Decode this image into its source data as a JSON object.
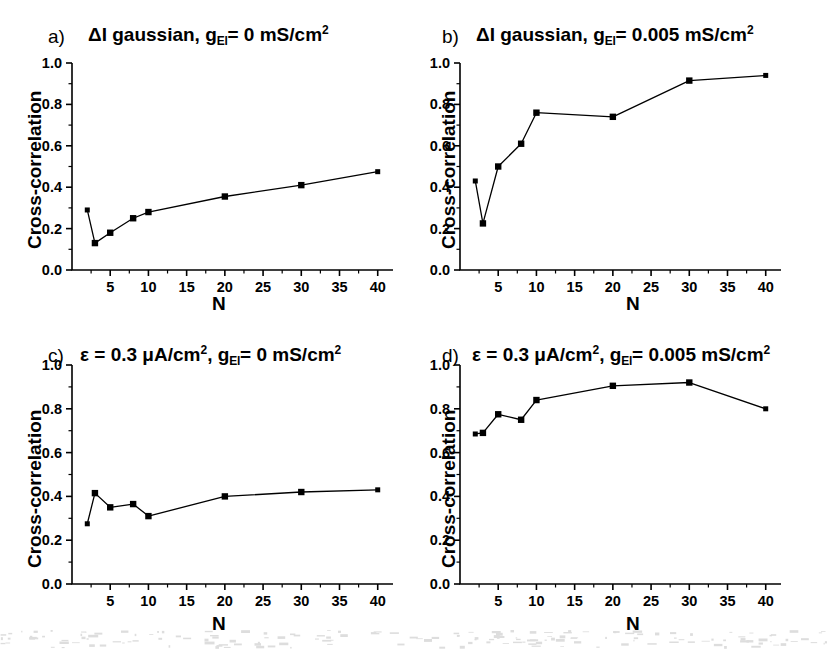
{
  "figure": {
    "axis": {
      "ylabel": "Cross-correlation",
      "xlabel": "N",
      "ylim": [
        0.0,
        1.0
      ],
      "xlim": [
        0,
        42
      ],
      "yticks": [
        "0.0",
        "0.2",
        "0.4",
        "0.6",
        "0.8",
        "1.0"
      ],
      "ytick_values": [
        0.0,
        0.2,
        0.4,
        0.6,
        0.8,
        1.0
      ],
      "xticks": [
        "5",
        "10",
        "15",
        "20",
        "25",
        "30",
        "35",
        "40"
      ],
      "xtick_values": [
        5,
        10,
        15,
        20,
        25,
        30,
        35,
        40
      ],
      "marker_color": "#000000",
      "line_color": "#000000"
    },
    "panels": [
      {
        "letter": "a)",
        "title_parts": {
          "pre": "ΔI gaussian, g",
          "sub": "El",
          "mid": "= 0 mS/cm",
          "sup": "2"
        },
        "title_plain": "ΔI gaussian, g_El = 0 mS/cm2"
      },
      {
        "letter": "b)",
        "title_parts": {
          "pre": "ΔI gaussian, g",
          "sub": "El",
          "mid": "= 0.005 mS/cm",
          "sup": "2"
        },
        "title_plain": "ΔI gaussian, g_El = 0.005 mS/cm2"
      },
      {
        "letter": "c)",
        "title_parts": {
          "pre": "ε = 0.3 μA/cm",
          "sup1": "2",
          "mid1": ", g",
          "sub": "El",
          "mid": "= 0 mS/cm",
          "sup": "2"
        },
        "title_plain": "ε = 0.3 μA/cm2, g_El = 0 mS/cm2"
      },
      {
        "letter": "d)",
        "title_parts": {
          "pre": "ε = 0.3 μA/cm",
          "sup1": "2",
          "mid1": ", g",
          "sub": "El",
          "mid": "= 0.005 mS/cm",
          "sup": "2"
        },
        "title_plain": "ε = 0.3 μA/cm2, g_El = 0.005 mS/cm2"
      }
    ]
  },
  "chart_data": [
    {
      "type": "line",
      "panel": "a",
      "title": "ΔI gaussian, g_El = 0 mS/cm2",
      "xlabel": "N",
      "ylabel": "Cross-correlation",
      "xlim": [
        0,
        42
      ],
      "ylim": [
        0.0,
        1.0
      ],
      "grid": false,
      "legend": null,
      "x": [
        2,
        3,
        5,
        8,
        10,
        20,
        30,
        40
      ],
      "values": [
        0.29,
        0.13,
        0.18,
        0.25,
        0.28,
        0.355,
        0.41,
        0.475
      ]
    },
    {
      "type": "line",
      "panel": "b",
      "title": "ΔI gaussian, g_El = 0.005 mS/cm2",
      "xlabel": "N",
      "ylabel": "Cross-correlation",
      "xlim": [
        0,
        42
      ],
      "ylim": [
        0.0,
        1.0
      ],
      "grid": false,
      "legend": null,
      "x": [
        2,
        3,
        5,
        8,
        10,
        20,
        30,
        40
      ],
      "values": [
        0.43,
        0.225,
        0.5,
        0.61,
        0.76,
        0.74,
        0.915,
        0.94
      ]
    },
    {
      "type": "line",
      "panel": "c",
      "title": "ε = 0.3 μA/cm2, g_El = 0 mS/cm2",
      "xlabel": "N",
      "ylabel": "Cross-correlation",
      "xlim": [
        0,
        42
      ],
      "ylim": [
        0.0,
        1.0
      ],
      "grid": false,
      "legend": null,
      "x": [
        2,
        3,
        5,
        8,
        10,
        20,
        30,
        40
      ],
      "values": [
        0.275,
        0.415,
        0.35,
        0.365,
        0.31,
        0.4,
        0.42,
        0.43
      ]
    },
    {
      "type": "line",
      "panel": "d",
      "title": "ε = 0.3 μA/cm2, g_El = 0.005 mS/cm2",
      "xlabel": "N",
      "ylabel": "Cross-correlation",
      "xlim": [
        0,
        42
      ],
      "ylim": [
        0.0,
        1.0
      ],
      "grid": false,
      "legend": null,
      "x": [
        2,
        3,
        5,
        8,
        10,
        20,
        30,
        40
      ],
      "values": [
        0.685,
        0.69,
        0.775,
        0.75,
        0.84,
        0.905,
        0.92,
        0.8
      ]
    }
  ]
}
